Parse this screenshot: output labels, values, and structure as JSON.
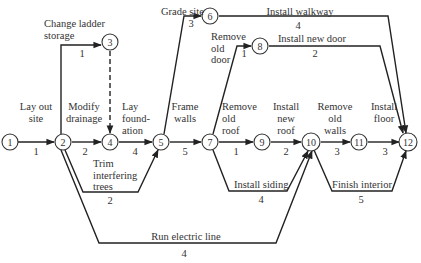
{
  "nodes": [
    {
      "id": "1",
      "x": 10,
      "y": 142
    },
    {
      "id": "2",
      "x": 63,
      "y": 142
    },
    {
      "id": "3",
      "x": 110,
      "y": 42
    },
    {
      "id": "4",
      "x": 110,
      "y": 142
    },
    {
      "id": "5",
      "x": 161,
      "y": 142
    },
    {
      "id": "6",
      "x": 210,
      "y": 16
    },
    {
      "id": "7",
      "x": 210,
      "y": 142
    },
    {
      "id": "8",
      "x": 260,
      "y": 46
    },
    {
      "id": "9",
      "x": 262,
      "y": 142
    },
    {
      "id": "10",
      "x": 311,
      "y": 142
    },
    {
      "id": "11",
      "x": 359,
      "y": 142
    },
    {
      "id": "12",
      "x": 408,
      "y": 142
    }
  ],
  "activities": [
    {
      "name": "Lay out site",
      "from": "1",
      "to": "2",
      "duration": "1"
    },
    {
      "name": "Change ladder storage",
      "from": "2",
      "to": "3",
      "duration": "1"
    },
    {
      "name": "Dummy",
      "from": "3",
      "to": "4",
      "duration": ""
    },
    {
      "name": "Modify drainage",
      "from": "2",
      "to": "4",
      "duration": "2"
    },
    {
      "name": "Trim interfering trees",
      "from": "2",
      "to": "5",
      "duration": "2"
    },
    {
      "name": "Lay foundation",
      "from": "4",
      "to": "5",
      "duration": "4"
    },
    {
      "name": "Grade site",
      "from": "5",
      "to": "6",
      "duration": "3"
    },
    {
      "name": "Frame walls",
      "from": "5",
      "to": "7",
      "duration": "5"
    },
    {
      "name": "Install walkway",
      "from": "6",
      "to": "12",
      "duration": "4"
    },
    {
      "name": "Remove old door",
      "from": "7",
      "to": "8",
      "duration": "1"
    },
    {
      "name": "Install new door",
      "from": "8",
      "to": "12",
      "duration": "2"
    },
    {
      "name": "Remove old roof",
      "from": "7",
      "to": "9",
      "duration": "1"
    },
    {
      "name": "Install new roof",
      "from": "9",
      "to": "10",
      "duration": "2"
    },
    {
      "name": "Install siding",
      "from": "7",
      "to": "10",
      "duration": "4"
    },
    {
      "name": "Run electric line",
      "from": "2",
      "to": "10",
      "duration": "4"
    },
    {
      "name": "Remove old walls",
      "from": "10",
      "to": "11",
      "duration": "3"
    },
    {
      "name": "Install floor",
      "from": "11",
      "to": "12",
      "duration": "3"
    },
    {
      "name": "Finish interior",
      "from": "10",
      "to": "12",
      "duration": "5"
    }
  ],
  "labels": {
    "lay_out_site_1": "Lay out",
    "lay_out_site_2": "site",
    "change_ladder_1": "Change ladder",
    "change_ladder_2": "storage",
    "modify_drainage_1": "Modify",
    "modify_drainage_2": "drainage",
    "lay_foundation_1": "Lay",
    "lay_foundation_2": "found-",
    "lay_foundation_3": "ation",
    "trim_trees_1": "Trim",
    "trim_trees_2": "interfering",
    "trim_trees_3": "trees",
    "grade_site": "Grade site",
    "frame_walls_1": "Frame",
    "frame_walls_2": "walls",
    "install_walkway": "Install walkway",
    "remove_door_1": "Remove",
    "remove_door_2": "old",
    "remove_door_3": "door",
    "install_door": "Install new door",
    "remove_roof_1": "Remove",
    "remove_roof_2": "old",
    "remove_roof_3": "roof",
    "install_roof_1": "Install",
    "install_roof_2": "new",
    "install_roof_3": "roof",
    "install_siding": "Install siding",
    "run_electric": "Run electric line",
    "remove_walls_1": "Remove",
    "remove_walls_2": "old",
    "remove_walls_3": "walls",
    "install_floor_1": "Install",
    "install_floor_2": "floor",
    "finish_interior": "Finish interior"
  },
  "durations": {
    "d_1_2": "1",
    "d_2_3": "1",
    "d_2_4": "2",
    "d_2_5": "2",
    "d_4_5": "4",
    "d_5_6": "3",
    "d_5_7": "5",
    "d_6_12": "4",
    "d_7_8": "1",
    "d_8_12": "2",
    "d_7_9": "1",
    "d_9_10": "2",
    "d_7_10": "4",
    "d_2_10": "4",
    "d_10_11": "3",
    "d_11_12": "3",
    "d_10_12": "5"
  },
  "node_labels": {
    "n1": "1",
    "n2": "2",
    "n3": "3",
    "n4": "4",
    "n5": "5",
    "n6": "6",
    "n7": "7",
    "n8": "8",
    "n9": "9",
    "n10": "10",
    "n11": "11",
    "n12": "12"
  }
}
